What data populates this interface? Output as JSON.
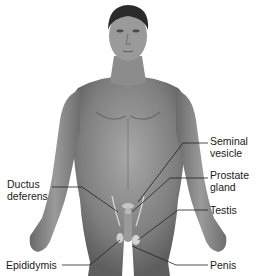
{
  "figure": {
    "colors": {
      "skin_dark": "#5a5a5a",
      "skin_mid": "#8a8a8a",
      "skin_light": "#b0b0b0",
      "hair": "#2a2a2a",
      "leader": "#222222",
      "text": "#1a1a1a"
    }
  },
  "labels": {
    "seminal_vesicle": "Seminal\nvesicle",
    "prostate_gland": "Prostate\ngland",
    "testis": "Testis",
    "ductus_deferens": "Ductus\ndeferens",
    "epididymis": "Epididymis",
    "penis": "Penis"
  }
}
